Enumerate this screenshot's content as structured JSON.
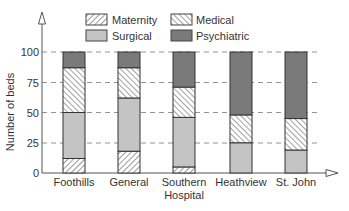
{
  "chart_data": {
    "type": "bar",
    "stacked": true,
    "title": "",
    "xlabel": "",
    "ylabel": "Number of beds",
    "ylim": [
      0,
      100
    ],
    "yticks": [
      0,
      25,
      50,
      75,
      100
    ],
    "grid": "dashed horizontal at 25, 50, 75, 100",
    "legend_position": "top",
    "categories": [
      "Foothills",
      "General",
      "Southern Hospital",
      "Heathview",
      "St. John"
    ],
    "series": [
      {
        "name": "Maternity",
        "pattern": "hatch-forward",
        "values": [
          12,
          18,
          5,
          0,
          0
        ]
      },
      {
        "name": "Surgical",
        "pattern": "light-gray",
        "values": [
          38,
          44,
          41,
          25,
          19
        ]
      },
      {
        "name": "Medical",
        "pattern": "hatch-backward",
        "values": [
          37,
          25,
          25,
          23,
          26
        ]
      },
      {
        "name": "Psychiatric",
        "pattern": "dark-gray",
        "values": [
          13,
          13,
          29,
          52,
          55
        ]
      }
    ]
  },
  "legend": {
    "maternity": "Maternity",
    "medical": "Medical",
    "surgical": "Surgical",
    "psychiatric": "Psychiatric"
  },
  "axis": {
    "ylabel": "Number of beds",
    "ticks": [
      "0",
      "25",
      "50",
      "75",
      "100"
    ],
    "categories": [
      "Foothills",
      "General",
      "Southern",
      "Heathview",
      "St. John"
    ],
    "category_line2": [
      "",
      "",
      "Hospital",
      "",
      ""
    ]
  },
  "colors": {
    "surgical": "#c4c4c4",
    "psychiatric": "#7a7a7a",
    "axis": "#555555"
  }
}
